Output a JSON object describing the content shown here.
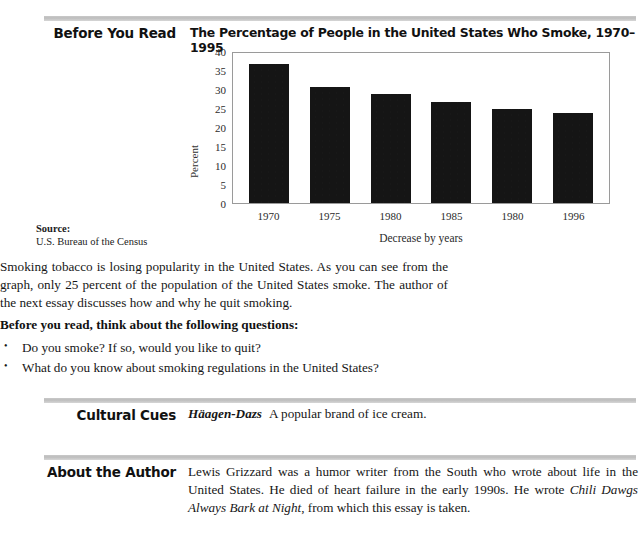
{
  "sections": {
    "before_you_read": {
      "heading": "Before You Read",
      "paragraph": "Smoking tobacco is losing popularity in the United States. As you can see from the graph, only 25 percent of the population of the United States smoke. The author of the next essay discusses how and why he quit smoking.",
      "questions_heading": "Before you read, think about the following questions:",
      "bullet_marker": "•",
      "questions": [
        "Do you smoke? If so, would you like to quit?",
        "What do you know about smoking regulations in the United States?"
      ]
    },
    "cultural_cues": {
      "heading": "Cultural Cues",
      "term": "Häagen-Dazs",
      "definition": "A popular brand of ice cream."
    },
    "about_the_author": {
      "heading": "About the Author",
      "text_before_title": "Lewis Grizzard was a humor writer from the South who wrote about life in the United States. He died of heart failure in the early 1990s. He wrote ",
      "book_title": "Chili Dawgs Always Bark at Night",
      "text_after_title": ", from which this essay is taken."
    }
  },
  "source": {
    "label": "Source:",
    "text": "U.S. Bureau of the Census"
  },
  "chart_data": {
    "type": "bar",
    "title": "The Percentage of People in the United States Who Smoke, 1970–1995",
    "categories": [
      "1970",
      "1975",
      "1980",
      "1985",
      "1980",
      "1996"
    ],
    "values": [
      37,
      31,
      29,
      27,
      25,
      24
    ],
    "xlabel": "Decrease by years",
    "ylabel": "Percent",
    "ylim": [
      0,
      40
    ],
    "yticks": [
      40,
      35,
      30,
      25,
      20,
      15,
      10,
      5,
      0
    ],
    "grid": false,
    "legend": false,
    "bar_color": "#151515",
    "frame_color": "#9a9a9a"
  },
  "colors": {
    "rule": "#c4c4c4",
    "heading": "#111111",
    "text": "#161616",
    "page_background": "#ffffff"
  }
}
